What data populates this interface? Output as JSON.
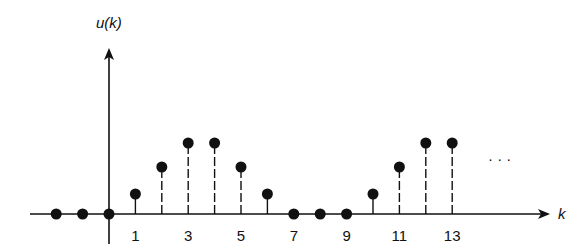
{
  "figure": {
    "y_axis_label": "u(k)",
    "x_axis_label": "k",
    "continuation": "· · ·",
    "tick_labels": [
      "1",
      "3",
      "5",
      "7",
      "9",
      "11",
      "13"
    ]
  },
  "chart_data": {
    "type": "stem",
    "title": "",
    "xlabel": "k",
    "ylabel": "u(k)",
    "x": [
      -2,
      -1,
      0,
      1,
      2,
      3,
      4,
      5,
      6,
      7,
      8,
      9,
      10,
      11,
      12,
      13
    ],
    "values": [
      0,
      0,
      0,
      1,
      2,
      3,
      3,
      2,
      1,
      0,
      0,
      0,
      1,
      2,
      3,
      3
    ],
    "x_tick_labels": [
      1,
      3,
      5,
      7,
      9,
      11,
      13
    ],
    "continues": true,
    "grid": false
  }
}
